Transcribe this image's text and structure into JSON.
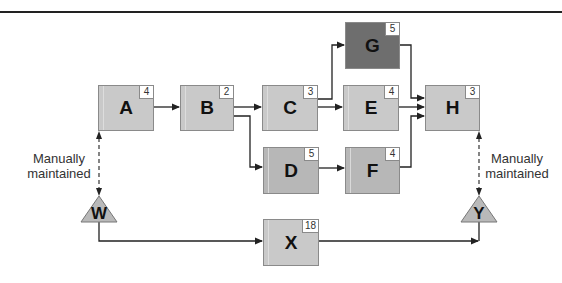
{
  "diagram": {
    "type": "dependency-flow",
    "nodes": [
      {
        "id": "A",
        "label": "A",
        "value": "4",
        "shade": "light"
      },
      {
        "id": "B",
        "label": "B",
        "value": "2",
        "shade": "light"
      },
      {
        "id": "C",
        "label": "C",
        "value": "3",
        "shade": "light"
      },
      {
        "id": "D",
        "label": "D",
        "value": "5",
        "shade": "mid"
      },
      {
        "id": "E",
        "label": "E",
        "value": "4",
        "shade": "light"
      },
      {
        "id": "F",
        "label": "F",
        "value": "4",
        "shade": "mid"
      },
      {
        "id": "G",
        "label": "G",
        "value": "5",
        "shade": "dark"
      },
      {
        "id": "H",
        "label": "H",
        "value": "3",
        "shade": "light"
      },
      {
        "id": "X",
        "label": "X",
        "value": "18",
        "shade": "light"
      }
    ],
    "triangles": [
      {
        "id": "W",
        "label": "W"
      },
      {
        "id": "Y",
        "label": "Y"
      }
    ],
    "edges": [
      {
        "from": "A",
        "to": "B",
        "style": "solid"
      },
      {
        "from": "B",
        "to": "C",
        "style": "solid"
      },
      {
        "from": "B",
        "to": "D",
        "style": "solid"
      },
      {
        "from": "C",
        "to": "G",
        "style": "solid"
      },
      {
        "from": "C",
        "to": "E",
        "style": "solid"
      },
      {
        "from": "D",
        "to": "F",
        "style": "solid"
      },
      {
        "from": "G",
        "to": "H",
        "style": "solid"
      },
      {
        "from": "E",
        "to": "H",
        "style": "solid"
      },
      {
        "from": "F",
        "to": "H",
        "style": "solid"
      },
      {
        "from": "W",
        "to": "X",
        "style": "solid"
      },
      {
        "from": "X",
        "to": "Y",
        "style": "solid"
      },
      {
        "from": "W",
        "to": "A",
        "style": "dashed-bidirectional"
      },
      {
        "from": "H",
        "to": "Y",
        "style": "dashed-bidirectional"
      }
    ],
    "annotations": {
      "left": {
        "line1": "Manually",
        "line2": "maintained"
      },
      "right": {
        "line1": "Manually",
        "line2": "maintained"
      }
    },
    "colors": {
      "light": "#c9c9c9",
      "mid": "#b7b7b7",
      "dark": "#6e6e6e",
      "line": "#222222"
    }
  }
}
